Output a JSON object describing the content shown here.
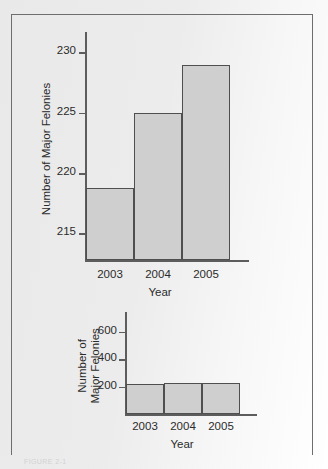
{
  "figure": {
    "caption": "FIGURE 2-1",
    "frame_color": "#6e6e6e",
    "bar_fill_color": "#cfcfcf",
    "bar_edge_color": "#4f4f4f",
    "axis_color": "#5d5d5d",
    "text_color": "#2b2b2b"
  },
  "chart_data": [
    {
      "type": "bar",
      "id": "truncated-axis-chart",
      "title": "",
      "categories": [
        "2003",
        "2004",
        "2005"
      ],
      "values": [
        218.8,
        225,
        229
      ],
      "xlabel": "Year",
      "ylabel": "Number of Major Felonies",
      "ylim": [
        212.8,
        231.2
      ],
      "yticks": [
        215,
        220,
        225,
        230
      ],
      "ytick_labels": [
        "215",
        "220",
        "225",
        "230"
      ],
      "grid": false,
      "legend": false
    },
    {
      "type": "bar",
      "id": "zero-based-axis-chart",
      "title": "",
      "categories": [
        "2003",
        "2004",
        "2005"
      ],
      "values": [
        218.8,
        225,
        229
      ],
      "xlabel": "Year",
      "ylabel": "Number of\nMajor Felonies",
      "ylim": [
        0,
        700
      ],
      "yticks": [
        200,
        400,
        600
      ],
      "ytick_labels": [
        "200",
        "400",
        "600"
      ],
      "grid": false,
      "legend": false
    }
  ],
  "chart_top": {
    "ylabel": "Number of Major Felonies",
    "xlabel": "Year",
    "yticks": [
      {
        "label": "215"
      },
      {
        "label": "220"
      },
      {
        "label": "225"
      },
      {
        "label": "230"
      }
    ],
    "bars": [
      {
        "category": "2003",
        "value": "218.8"
      },
      {
        "category": "2004",
        "value": "225"
      },
      {
        "category": "2005",
        "value": "229"
      }
    ]
  },
  "chart_bottom": {
    "ylabel": "Number of\nMajor Felonies",
    "xlabel": "Year",
    "yticks": [
      {
        "label": "200"
      },
      {
        "label": "400"
      },
      {
        "label": "600"
      }
    ],
    "bars": [
      {
        "category": "2003",
        "value": "218.8"
      },
      {
        "category": "2004",
        "value": "225"
      },
      {
        "category": "2005",
        "value": "229"
      }
    ]
  }
}
